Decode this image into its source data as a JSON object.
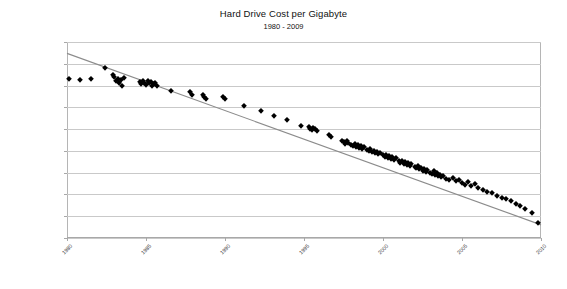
{
  "chart_data": {
    "type": "scatter",
    "title": "Hard Drive Cost per Gigabyte",
    "subtitle": "1980 - 2009",
    "xlabel": "",
    "ylabel": "",
    "grid": true,
    "legend": false,
    "yscale": "log",
    "ylim": [
      0.01,
      10000000
    ],
    "xlim": [
      1980,
      2010
    ],
    "ytick_labels": [
      "$10,000,000.00",
      "$1,000,000.00",
      "$100,000.00",
      "$10,000.00",
      "$1,000.00",
      "$100.00",
      "$10.00",
      "$1.00",
      "$0.10",
      "$0.01"
    ],
    "ytick_values": [
      10000000,
      1000000,
      100000,
      10000,
      1000,
      100,
      10,
      1,
      0.1,
      0.01
    ],
    "xtick_labels": [
      "1980",
      "1985",
      "1990",
      "1995",
      "2000",
      "2005",
      "2010"
    ],
    "xtick_values": [
      1980,
      1985,
      1990,
      1995,
      2000,
      2005,
      2010
    ],
    "marker": "diamond",
    "marker_color": "#000000",
    "trendline": {
      "color": "#8c8c8c",
      "x": [
        1980,
        2010
      ],
      "y": [
        3000000,
        0.04
      ]
    },
    "points": [
      [
        1980.1,
        193000
      ],
      [
        1980.8,
        186000
      ],
      [
        1981.5,
        205000
      ],
      [
        1982.4,
        640000
      ],
      [
        1982.9,
        300000
      ],
      [
        1983.0,
        240000
      ],
      [
        1983.1,
        160000
      ],
      [
        1983.2,
        210000
      ],
      [
        1983.3,
        130000
      ],
      [
        1983.4,
        175000
      ],
      [
        1983.5,
        98000
      ],
      [
        1983.6,
        220000
      ],
      [
        1984.6,
        150000
      ],
      [
        1984.7,
        120000
      ],
      [
        1984.8,
        170000
      ],
      [
        1984.9,
        135000
      ],
      [
        1985.0,
        105000
      ],
      [
        1985.1,
        155000
      ],
      [
        1985.2,
        125000
      ],
      [
        1985.3,
        145000
      ],
      [
        1985.4,
        92000
      ],
      [
        1985.5,
        115000
      ],
      [
        1985.6,
        138000
      ],
      [
        1985.7,
        100000
      ],
      [
        1986.6,
        56000
      ],
      [
        1987.8,
        50000
      ],
      [
        1987.9,
        36000
      ],
      [
        1988.6,
        38000
      ],
      [
        1988.7,
        30000
      ],
      [
        1988.8,
        25000
      ],
      [
        1989.9,
        30000
      ],
      [
        1990.0,
        23000
      ],
      [
        1991.2,
        11000
      ],
      [
        1992.3,
        6500
      ],
      [
        1993.1,
        4200
      ],
      [
        1993.9,
        2600
      ],
      [
        1994.8,
        1400
      ],
      [
        1995.3,
        1250
      ],
      [
        1995.4,
        1050
      ],
      [
        1995.5,
        900
      ],
      [
        1995.6,
        1150
      ],
      [
        1995.7,
        980
      ],
      [
        1995.8,
        820
      ],
      [
        1996.6,
        520
      ],
      [
        1996.7,
        440
      ],
      [
        1997.4,
        290
      ],
      [
        1997.5,
        250
      ],
      [
        1997.6,
        215
      ],
      [
        1997.7,
        270
      ],
      [
        1997.8,
        235
      ],
      [
        1998.0,
        190
      ],
      [
        1998.1,
        165
      ],
      [
        1998.2,
        205
      ],
      [
        1998.3,
        150
      ],
      [
        1998.4,
        178
      ],
      [
        1998.5,
        140
      ],
      [
        1998.6,
        160
      ],
      [
        1998.7,
        125
      ],
      [
        1998.8,
        145
      ],
      [
        1999.0,
        110
      ],
      [
        1999.1,
        95
      ],
      [
        1999.2,
        120
      ],
      [
        1999.3,
        85
      ],
      [
        1999.4,
        100
      ],
      [
        1999.5,
        78
      ],
      [
        1999.6,
        92
      ],
      [
        1999.7,
        70
      ],
      [
        1999.8,
        83
      ],
      [
        2000.0,
        62
      ],
      [
        2000.1,
        55
      ],
      [
        2000.2,
        68
      ],
      [
        2000.3,
        48
      ],
      [
        2000.4,
        58
      ],
      [
        2000.5,
        43
      ],
      [
        2000.6,
        52
      ],
      [
        2000.7,
        38
      ],
      [
        2000.8,
        46
      ],
      [
        2001.0,
        33
      ],
      [
        2001.1,
        29
      ],
      [
        2001.2,
        36
      ],
      [
        2001.3,
        26
      ],
      [
        2001.4,
        31
      ],
      [
        2001.5,
        23
      ],
      [
        2001.6,
        28
      ],
      [
        2001.7,
        21
      ],
      [
        2001.8,
        25
      ],
      [
        2002.0,
        18
      ],
      [
        2002.1,
        16
      ],
      [
        2002.2,
        20
      ],
      [
        2002.3,
        14
      ],
      [
        2002.4,
        17
      ],
      [
        2002.5,
        12.5
      ],
      [
        2002.6,
        15
      ],
      [
        2002.7,
        11
      ],
      [
        2002.8,
        13.5
      ],
      [
        2003.0,
        10
      ],
      [
        2003.1,
        8.5
      ],
      [
        2003.2,
        11.5
      ],
      [
        2003.3,
        7.5
      ],
      [
        2003.4,
        9.2
      ],
      [
        2003.5,
        6.8
      ],
      [
        2003.6,
        8.0
      ],
      [
        2003.7,
        6.0
      ],
      [
        2003.8,
        7.2
      ],
      [
        2004.0,
        5.2
      ],
      [
        2004.2,
        4.6
      ],
      [
        2004.4,
        5.8
      ],
      [
        2004.6,
        4.0
      ],
      [
        2004.8,
        4.8
      ],
      [
        2005.0,
        3.2
      ],
      [
        2005.2,
        2.8
      ],
      [
        2005.4,
        3.6
      ],
      [
        2005.6,
        2.4
      ],
      [
        2005.8,
        2.9
      ],
      [
        2006.0,
        1.9
      ],
      [
        2006.3,
        1.6
      ],
      [
        2006.6,
        1.35
      ],
      [
        2006.9,
        1.15
      ],
      [
        2007.2,
        0.85
      ],
      [
        2007.5,
        0.72
      ],
      [
        2007.8,
        0.62
      ],
      [
        2008.1,
        0.48
      ],
      [
        2008.4,
        0.38
      ],
      [
        2008.7,
        0.3
      ],
      [
        2009.0,
        0.22
      ],
      [
        2009.4,
        0.14
      ],
      [
        2009.8,
        0.048
      ]
    ]
  }
}
